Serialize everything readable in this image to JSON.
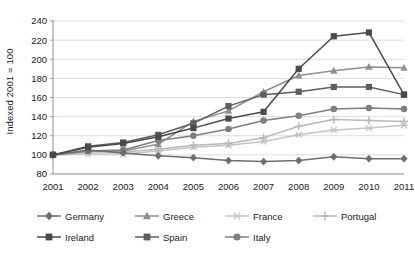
{
  "chart_data": {
    "type": "line",
    "title": "",
    "subtitle": "",
    "xlabel": "",
    "ylabel": "Indexed 2001 = 100",
    "x": [
      2001,
      2002,
      2003,
      2004,
      2005,
      2006,
      2007,
      2008,
      2009,
      2010,
      2011
    ],
    "xtick_labels": [
      "2001",
      "2002",
      "2003",
      "2004",
      "2005",
      "2006",
      "2007",
      "2008",
      "2009",
      "2010",
      "2011"
    ],
    "ytick_labels": [
      "240",
      "220",
      "200",
      "180",
      "160",
      "140",
      "120",
      "100",
      "80"
    ],
    "yticks": [
      240,
      220,
      200,
      180,
      160,
      140,
      120,
      100,
      80
    ],
    "ylim": [
      80,
      240
    ],
    "grid": "horizontal",
    "legend_position": "bottom",
    "series": [
      {
        "name": "Germany",
        "marker": "diamond",
        "color": "#6e6e6e",
        "values": [
          100,
          105,
          102,
          99,
          97,
          94,
          93,
          94,
          98,
          96,
          96
        ]
      },
      {
        "name": "Greece",
        "marker": "triangle",
        "color": "#8f8f8f",
        "values": [
          100,
          104,
          104,
          111,
          135,
          146,
          166,
          183,
          188,
          192,
          191
        ]
      },
      {
        "name": "France",
        "marker": "asterisk",
        "color": "#c4c4c4",
        "values": [
          100,
          101,
          101,
          104,
          108,
          110,
          114,
          121,
          126,
          128,
          131
        ]
      },
      {
        "name": "Portugal",
        "marker": "plus",
        "color": "#b8b8b8",
        "values": [
          100,
          103,
          103,
          106,
          110,
          112,
          118,
          130,
          137,
          136,
          135
        ]
      },
      {
        "name": "Ireland",
        "marker": "square",
        "color": "#4a4a4a",
        "values": [
          100,
          108,
          112,
          119,
          128,
          138,
          145,
          190,
          224,
          228,
          163
        ]
      },
      {
        "name": "Spain",
        "marker": "square",
        "color": "#5e5e5e",
        "values": [
          100,
          109,
          113,
          121,
          133,
          151,
          163,
          166,
          171,
          171,
          163
        ]
      },
      {
        "name": "Italy",
        "marker": "circle",
        "color": "#7f7f7f",
        "values": [
          100,
          104,
          105,
          115,
          120,
          127,
          136,
          141,
          148,
          149,
          148
        ]
      }
    ]
  },
  "legend": {
    "rows": [
      [
        "Germany",
        "Greece",
        "France",
        "Portugal"
      ],
      [
        "Ireland",
        "Spain",
        "Italy"
      ]
    ]
  },
  "colors": {
    "axis": "#9a9a9a",
    "grid": "#dcdcdc",
    "text": "#1a1a1a",
    "background": "#ffffff"
  }
}
